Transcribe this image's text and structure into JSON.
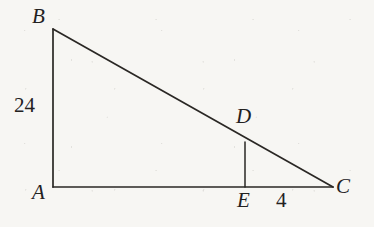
{
  "figure": {
    "kind": "geometry-diagram",
    "background_color": "#f7f6f3",
    "stroke_color": "#2a2724",
    "text_color": "#23211f",
    "stroke_width": 1.6,
    "vertices": [
      {
        "id": "B",
        "label": "B",
        "x": 53,
        "y": 29
      },
      {
        "id": "A",
        "label": "A",
        "x": 53,
        "y": 187
      },
      {
        "id": "C",
        "label": "C",
        "x": 333,
        "y": 187
      },
      {
        "id": "D",
        "label": "D",
        "x": 245,
        "y": 142
      },
      {
        "id": "E",
        "label": "E",
        "x": 245,
        "y": 187
      }
    ],
    "segments": [
      {
        "id": "AB",
        "from": "A",
        "to": "B",
        "x1": 53,
        "y1": 187,
        "x2": 53,
        "y2": 29
      },
      {
        "id": "AC",
        "from": "A",
        "to": "C",
        "x1": 53,
        "y1": 187,
        "x2": 333,
        "y2": 187
      },
      {
        "id": "BC",
        "from": "B",
        "to": "C",
        "x1": 53,
        "y1": 29,
        "x2": 333,
        "y2": 187
      },
      {
        "id": "DE",
        "from": "D",
        "to": "E",
        "x1": 245,
        "y1": 142,
        "x2": 245,
        "y2": 187
      }
    ],
    "measures": [
      {
        "id": "AB-length",
        "segment": "AB",
        "value": "24"
      },
      {
        "id": "EC-length",
        "segment": "EC",
        "value": "4"
      }
    ]
  },
  "chart_data": {
    "type": "diagram",
    "title": "",
    "shape": "right triangle with inscribed perpendicular segment",
    "points": {
      "A": [
        53,
        187
      ],
      "B": [
        53,
        29
      ],
      "C": [
        333,
        187
      ],
      "D": [
        245,
        142
      ],
      "E": [
        245,
        187
      ]
    },
    "edges": [
      "AB",
      "AC",
      "BC",
      "DE"
    ],
    "labels": [
      "A",
      "B",
      "C",
      "D",
      "E"
    ],
    "annotations": [
      {
        "text": "24",
        "refers_to": "AB"
      },
      {
        "text": "4",
        "refers_to": "EC"
      }
    ]
  }
}
